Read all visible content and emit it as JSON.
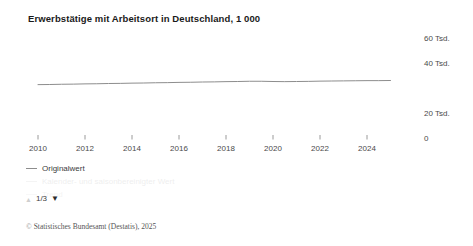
{
  "chart_data": {
    "type": "line",
    "title": "Erwerbstätige mit Arbeitsort in Deutschland, 1 000",
    "xlabel": "",
    "ylabel": "",
    "grid": false,
    "legend_position": "below-left",
    "y_axis_side": "right",
    "ylim": [
      0,
      60
    ],
    "xlim": [
      2010,
      2025.2
    ],
    "y_ticks": [
      {
        "value": 60,
        "label": "60 Tsd."
      },
      {
        "value": 40,
        "label": "40 Tsd."
      },
      {
        "value": 20,
        "label": "20 Tsd."
      },
      {
        "value": 0,
        "label": "0"
      }
    ],
    "x_ticks": [
      {
        "value": 2010,
        "label": "2010"
      },
      {
        "value": 2012,
        "label": "2012"
      },
      {
        "value": 2014,
        "label": "2014"
      },
      {
        "value": 2016,
        "label": "2016"
      },
      {
        "value": 2018,
        "label": "2018"
      },
      {
        "value": 2020,
        "label": "2020"
      },
      {
        "value": 2022,
        "label": "2022"
      },
      {
        "value": 2024,
        "label": "2024"
      }
    ],
    "series": [
      {
        "name": "Originalwert",
        "color": "#8d8d8d",
        "x": [
          2010,
          2010.5,
          2011,
          2011.5,
          2012,
          2012.5,
          2013,
          2013.5,
          2014,
          2014.5,
          2015,
          2015.5,
          2016,
          2016.5,
          2017,
          2017.5,
          2018,
          2018.5,
          2019,
          2019.5,
          2020,
          2020.5,
          2021,
          2021.5,
          2022,
          2022.5,
          2023,
          2023.5,
          2024,
          2024.5,
          2025
        ],
        "values": [
          43.9,
          44.0,
          44.2,
          44.3,
          44.5,
          44.6,
          44.8,
          44.9,
          45.1,
          45.2,
          45.4,
          45.5,
          45.7,
          45.8,
          46.0,
          46.1,
          46.3,
          46.4,
          46.6,
          46.6,
          46.4,
          46.3,
          46.4,
          46.5,
          46.7,
          46.8,
          46.9,
          47.0,
          47.1,
          47.1,
          47.2
        ]
      }
    ]
  },
  "legend": {
    "entries": [
      {
        "label": "Originalwert",
        "visible": true
      },
      {
        "label": "Kalender- und saisonbereinigter Wert",
        "visible": false
      },
      {
        "label": "Trend",
        "visible": false
      }
    ]
  },
  "pager": {
    "up_icon": "triangle-up-icon",
    "down_icon": "triangle-down-icon",
    "up_glyph": "▲",
    "down_glyph": "▼",
    "count_label": "1/3"
  },
  "footer": {
    "copyright_mark": "©",
    "text": "Statistisches Bundesamt (Destatis), 2025"
  },
  "colors": {
    "line": "#8d8d8d",
    "axis": "#9a9a9a",
    "title": "#1a1a1a",
    "tick_text": "#4a4a4a"
  }
}
